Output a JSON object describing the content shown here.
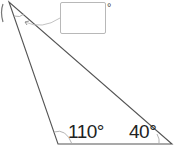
{
  "diagram": {
    "type": "triangle",
    "vertices": {
      "top": {
        "x": 9,
        "y": 2
      },
      "bottom_left": {
        "x": 58,
        "y": 144
      },
      "bottom_right": {
        "x": 172,
        "y": 144
      }
    },
    "angles": [
      {
        "vertex": "bottom_left",
        "label": "110°"
      },
      {
        "vertex": "bottom_right",
        "label": "40°"
      },
      {
        "vertex": "top",
        "label": "",
        "answer_box": true
      }
    ],
    "answer_box": {
      "value": "",
      "unit": "°"
    },
    "colors": {
      "line": "#555555",
      "arc": "#aaaaaa",
      "box_border": "#b8b8b8"
    }
  }
}
